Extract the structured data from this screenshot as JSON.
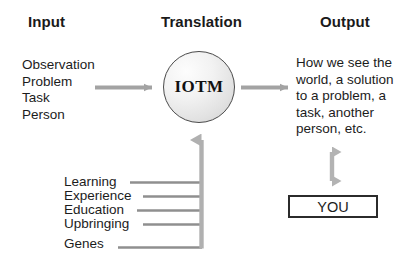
{
  "diagram": {
    "title_row": {
      "input": "Input",
      "translation": "Translation",
      "output": "Output"
    },
    "input_items": "Observation\nProblem\nTask\nPerson",
    "translation_node": {
      "label": "IOTM",
      "shape": "circle"
    },
    "output_text": "How we see the world, a solution to a problem, a task, another person, etc.",
    "influence_factors": [
      {
        "label": "Learning"
      },
      {
        "label": "Experience"
      },
      {
        "label": "Education"
      },
      {
        "label": "Upbringing"
      },
      {
        "label": "Genes"
      }
    ],
    "observer_box": {
      "label": "YOU"
    },
    "colors": {
      "text": "#1c1c1c",
      "arrow": "#9a9a9a",
      "connector_line": "#8f8f8f",
      "circle_border": "#4a4a4a",
      "box_border": "#2b2b2b",
      "background": "#ffffff"
    }
  }
}
